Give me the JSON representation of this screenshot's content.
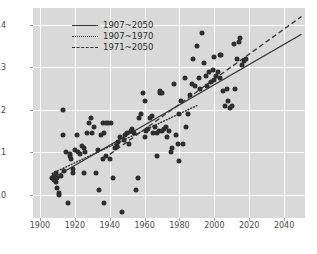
{
  "chart_data": {
    "type": "scatter",
    "title": "",
    "xlabel": "",
    "ylabel": "",
    "xlim": [
      1896,
      2052
    ],
    "ylim": [
      9.45,
      14.4
    ],
    "grid": true,
    "legend_position": "upper-left",
    "xticks": [
      1900,
      1920,
      1940,
      1960,
      1980,
      2000,
      2020,
      2040
    ],
    "yticks": [
      10,
      11,
      12,
      13,
      14
    ],
    "legend": [
      {
        "label": "1907~2050",
        "style": "solid"
      },
      {
        "label": "1907~1970",
        "style": "dotted"
      },
      {
        "label": "1971~2050",
        "style": "dashed"
      }
    ],
    "series": [
      {
        "name": "observations",
        "type": "scatter",
        "marker": "circle",
        "color": "#2e2e2e",
        "points": [
          [
            1907,
            10.4
          ],
          [
            1908,
            10.35
          ],
          [
            1908,
            10.45
          ],
          [
            1909,
            10.3
          ],
          [
            1909,
            10.5
          ],
          [
            1910,
            10.4
          ],
          [
            1910,
            10.15
          ],
          [
            1911,
            10.05
          ],
          [
            1911,
            10.0
          ],
          [
            1912,
            10.45
          ],
          [
            1913,
            11.4
          ],
          [
            1913,
            12.0
          ],
          [
            1914,
            10.55
          ],
          [
            1915,
            11.0
          ],
          [
            1916,
            9.8
          ],
          [
            1917,
            10.9
          ],
          [
            1917,
            10.95
          ],
          [
            1918,
            10.85
          ],
          [
            1919,
            10.6
          ],
          [
            1919,
            10.5
          ],
          [
            1920,
            11.05
          ],
          [
            1921,
            11.4
          ],
          [
            1922,
            11.0
          ],
          [
            1923,
            10.95
          ],
          [
            1924,
            11.15
          ],
          [
            1925,
            11.1
          ],
          [
            1925,
            10.5
          ],
          [
            1926,
            11.0
          ],
          [
            1927,
            11.45
          ],
          [
            1928,
            11.7
          ],
          [
            1929,
            11.8
          ],
          [
            1930,
            11.45
          ],
          [
            1931,
            11.6
          ],
          [
            1932,
            10.5
          ],
          [
            1933,
            11.05
          ],
          [
            1934,
            10.1
          ],
          [
            1935,
            11.4
          ],
          [
            1936,
            11.7
          ],
          [
            1936,
            10.85
          ],
          [
            1937,
            11.45
          ],
          [
            1937,
            9.8
          ],
          [
            1938,
            11.7
          ],
          [
            1938,
            10.9
          ],
          [
            1939,
            11.7
          ],
          [
            1940,
            10.85
          ],
          [
            1941,
            11.7
          ],
          [
            1942,
            10.4
          ],
          [
            1943,
            11.1
          ],
          [
            1944,
            11.15
          ],
          [
            1945,
            11.25
          ],
          [
            1946,
            11.35
          ],
          [
            1947,
            9.6
          ],
          [
            1948,
            11.3
          ],
          [
            1949,
            11.4
          ],
          [
            1950,
            11.45
          ],
          [
            1951,
            11.2
          ],
          [
            1952,
            11.5
          ],
          [
            1953,
            11.55
          ],
          [
            1954,
            11.45
          ],
          [
            1955,
            10.1
          ],
          [
            1956,
            10.4
          ],
          [
            1957,
            11.8
          ],
          [
            1958,
            11.9
          ],
          [
            1959,
            12.4
          ],
          [
            1960,
            12.2
          ],
          [
            1960,
            11.35
          ],
          [
            1961,
            11.5
          ],
          [
            1962,
            11.55
          ],
          [
            1963,
            11.8
          ],
          [
            1964,
            11.85
          ],
          [
            1965,
            11.45
          ],
          [
            1966,
            11.6
          ],
          [
            1967,
            11.45
          ],
          [
            1967,
            10.9
          ],
          [
            1968,
            11.5
          ],
          [
            1969,
            12.45
          ],
          [
            1969,
            12.4
          ],
          [
            1970,
            12.4
          ],
          [
            1970,
            11.5
          ],
          [
            1971,
            11.55
          ],
          [
            1972,
            11.6
          ],
          [
            1973,
            11.35
          ],
          [
            1974,
            11.5
          ],
          [
            1975,
            11.0
          ],
          [
            1976,
            11.1
          ],
          [
            1977,
            12.6
          ],
          [
            1978,
            11.4
          ],
          [
            1979,
            11.2
          ],
          [
            1980,
            11.9
          ],
          [
            1980,
            10.8
          ],
          [
            1981,
            12.2
          ],
          [
            1982,
            11.2
          ],
          [
            1983,
            12.75
          ],
          [
            1984,
            11.6
          ],
          [
            1985,
            11.9
          ],
          [
            1986,
            12.35
          ],
          [
            1987,
            12.6
          ],
          [
            1988,
            13.2
          ],
          [
            1989,
            12.55
          ],
          [
            1990,
            13.5
          ],
          [
            1991,
            12.75
          ],
          [
            1992,
            12.5
          ],
          [
            1993,
            13.8
          ],
          [
            1994,
            13.1
          ],
          [
            1995,
            12.8
          ],
          [
            1996,
            12.55
          ],
          [
            1997,
            12.9
          ],
          [
            1998,
            12.65
          ],
          [
            1999,
            12.95
          ],
          [
            2000,
            13.25
          ],
          [
            2000,
            12.7
          ],
          [
            2001,
            12.8
          ],
          [
            2002,
            12.9
          ],
          [
            2003,
            12.75
          ],
          [
            2003,
            13.3
          ],
          [
            2004,
            13.3
          ],
          [
            2005,
            12.45
          ],
          [
            2006,
            12.1
          ],
          [
            2007,
            12.5
          ],
          [
            2008,
            12.2
          ],
          [
            2009,
            12.05
          ],
          [
            2010,
            12.1
          ],
          [
            2011,
            13.55
          ],
          [
            2012,
            12.5
          ],
          [
            2013,
            13.2
          ],
          [
            2014,
            13.6
          ],
          [
            2015,
            13.7
          ],
          [
            2016,
            13.05
          ],
          [
            2017,
            13.15
          ],
          [
            2018,
            13.2
          ]
        ]
      }
    ],
    "trendlines": [
      {
        "name": "1907~2050",
        "style": "solid",
        "x": [
          1907,
          2050
        ],
        "y": [
          10.38,
          13.78
        ]
      },
      {
        "name": "1907~1970",
        "style": "dotted",
        "x": [
          1907,
          1990
        ],
        "y": [
          10.5,
          12.1
        ]
      },
      {
        "name": "1971~2050",
        "style": "dashed",
        "x": [
          1940,
          2050
        ],
        "y": [
          10.95,
          14.2
        ]
      }
    ]
  }
}
